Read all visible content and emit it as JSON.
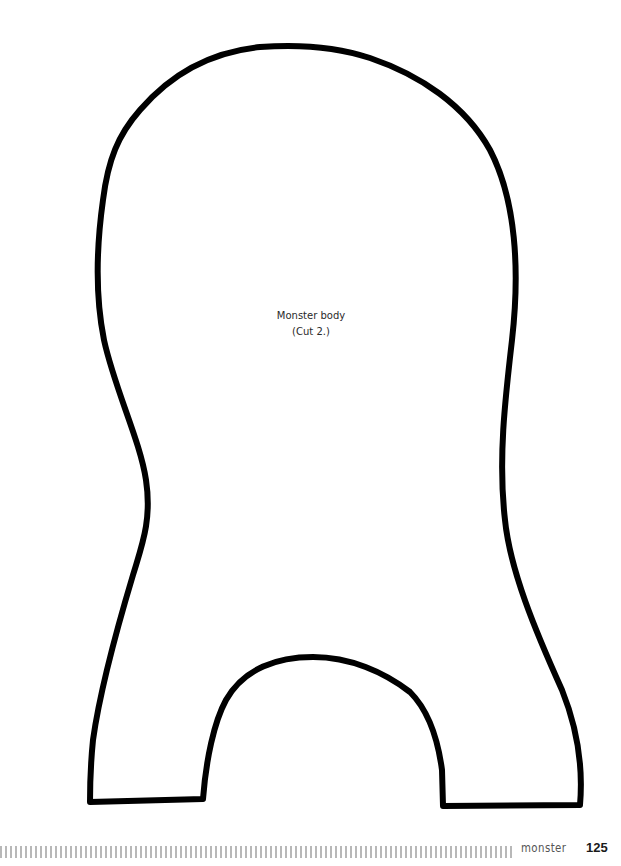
{
  "pattern": {
    "name": "monster-body-pattern",
    "label_line1": "Monster body",
    "label_line2": "(Cut 2.)",
    "outline_color": "#000000",
    "outline_width": 6
  },
  "footer": {
    "section_title": "monster",
    "page_number": "125",
    "bar_color": "#b8b8b8"
  }
}
